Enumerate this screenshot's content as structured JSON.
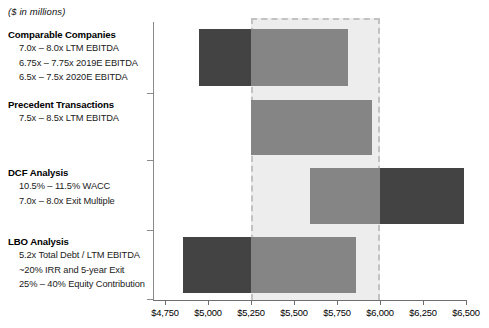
{
  "units_note": "($ in millions)",
  "methods": [
    {
      "title": "Comparable Companies",
      "lines": [
        "7.0x – 8.0x LTM EBITDA",
        "6.75x – 7.75x 2019E EBITDA",
        "6.5x – 7.5x 2020E EBITDA"
      ]
    },
    {
      "title": "Precedent Transactions",
      "lines": [
        "7.5x – 8.5x LTM EBITDA"
      ]
    },
    {
      "title": "DCF Analysis",
      "lines": [
        "10.5% – 11.5% WACC",
        "7.0x – 8.0x Exit Multiple"
      ]
    },
    {
      "title": "LBO Analysis",
      "lines": [
        "5.2x Total Debt / LTM EBITDA",
        "~20% IRR and 5-year Exit",
        "25% – 40% Equity Contribution"
      ]
    }
  ],
  "axis": {
    "ticks": [
      "$4,750",
      "$5,000",
      "$5,250",
      "$5,500",
      "$5,750",
      "$6,000",
      "$6,250",
      "$6,500"
    ],
    "min": 4750,
    "max": 6500,
    "step": 250
  },
  "band": {
    "low": 5250,
    "high": 6000,
    "fill": "#ededed",
    "border": "#c2c2c2"
  },
  "colors": {
    "dark": "#434343",
    "mid": "#858585",
    "axis": "#6e6e6e"
  },
  "chart_data": {
    "type": "bar",
    "title": "",
    "subtitle": "($ in millions)",
    "xlabel": "",
    "ylabel": "",
    "xlim": [
      4750,
      6500
    ],
    "grid": false,
    "legend": false,
    "orientation": "horizontal",
    "categories": [
      "Comparable Companies",
      "Precedent Transactions",
      "DCF Analysis",
      "LBO Analysis"
    ],
    "ranges": [
      {
        "category": "Comparable Companies",
        "low": 4950,
        "high": 5815,
        "segments": [
          {
            "from": 4950,
            "to": 5250,
            "color": "dark"
          },
          {
            "from": 5250,
            "to": 5815,
            "color": "mid"
          }
        ]
      },
      {
        "category": "Precedent Transactions",
        "low": 5250,
        "high": 5955,
        "segments": [
          {
            "from": 5250,
            "to": 5955,
            "color": "mid"
          }
        ]
      },
      {
        "category": "DCF Analysis",
        "low": 5595,
        "high": 6490,
        "segments": [
          {
            "from": 5595,
            "to": 6000,
            "color": "mid"
          },
          {
            "from": 6000,
            "to": 6490,
            "color": "dark"
          }
        ]
      },
      {
        "category": "LBO Analysis",
        "low": 4855,
        "high": 5860,
        "segments": [
          {
            "from": 4855,
            "to": 5250,
            "color": "dark"
          },
          {
            "from": 5250,
            "to": 5860,
            "color": "mid"
          }
        ]
      }
    ],
    "highlight_band": {
      "low": 5250,
      "high": 6000
    },
    "tick_labels": [
      "$4,750",
      "$5,000",
      "$5,250",
      "$5,500",
      "$5,750",
      "$6,000",
      "$6,250",
      "$6,500"
    ],
    "annotations": [
      "7.0x – 8.0x LTM EBITDA",
      "6.75x – 7.75x 2019E EBITDA",
      "6.5x – 7.5x 2020E EBITDA",
      "7.5x – 8.5x LTM EBITDA",
      "10.5% – 11.5% WACC",
      "7.0x – 8.0x Exit Multiple",
      "5.2x Total Debt / LTM EBITDA",
      "~20% IRR and 5-year Exit",
      "25% – 40% Equity Contribution"
    ]
  },
  "layout": {
    "rows": [
      {
        "top": 29,
        "height": 57
      },
      {
        "top": 100,
        "height": 55
      },
      {
        "top": 168,
        "height": 56
      },
      {
        "top": 237,
        "height": 56
      }
    ],
    "group_tops": [
      28,
      98,
      166,
      235
    ],
    "spine_ticks": [
      93,
      160,
      230,
      299
    ]
  }
}
